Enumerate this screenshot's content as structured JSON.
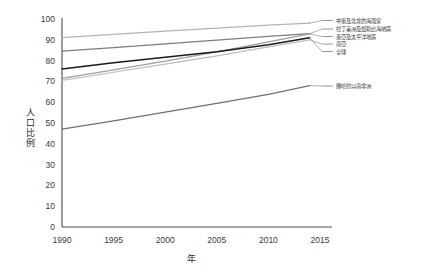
{
  "chart_data": {
    "type": "line",
    "title": "",
    "xlabel": "年",
    "ylabel": "人口比例",
    "xlim": [
      1990,
      2015
    ],
    "ylim": [
      0,
      100
    ],
    "xticks": [
      "1990",
      "1995",
      "2000",
      "2005",
      "2010",
      "2015"
    ],
    "xtick_values": [
      1990,
      1995,
      2000,
      2005,
      2010,
      2015
    ],
    "yticks": [
      "0",
      "10",
      "20",
      "30",
      "40",
      "50",
      "60",
      "70",
      "80",
      "90",
      "100"
    ],
    "ytick_values": [
      0,
      10,
      20,
      30,
      40,
      50,
      60,
      70,
      80,
      90,
      100
    ],
    "grid": false,
    "legend_position": "right-outside-with-leader-lines",
    "x": [
      1990,
      1995,
      2000,
      2005,
      2010,
      2014
    ],
    "series": [
      {
        "name": "中東及北非的海灣家",
        "color": "#b4b4b4",
        "width": 1.25,
        "values": [
          91.0,
          92.6,
          94.2,
          95.6,
          97.0,
          98.0
        ]
      },
      {
        "name": "拉丁美洲及加勒比海地區",
        "color": "#7d7d7d",
        "width": 1.25,
        "values": [
          84.5,
          86.2,
          88.0,
          89.8,
          91.6,
          93.0
        ]
      },
      {
        "name": "東亞及太平洋地區",
        "color": "#9e9e9e",
        "width": 1.25,
        "values": [
          71.5,
          75.5,
          79.8,
          84.2,
          89.0,
          92.8
        ]
      },
      {
        "name": "南亞",
        "color": "#bdbdbd",
        "width": 1.25,
        "values": [
          70.5,
          74.4,
          78.3,
          82.3,
          86.6,
          90.0
        ]
      },
      {
        "name": "全球",
        "color": "#1a1a1a",
        "width": 1.5,
        "values": [
          76.0,
          79.0,
          81.6,
          84.2,
          87.6,
          91.0
        ]
      },
      {
        "name": "撒哈拉以南非洲",
        "color": "#6f6f6f",
        "width": 1.25,
        "values": [
          47.0,
          51.0,
          55.2,
          59.4,
          63.8,
          68.0
        ]
      }
    ],
    "legend_entries": [
      {
        "label": "中東及北非的海灣家",
        "color": "#b4b4b4"
      },
      {
        "label": "拉丁美洲及加勒比海地區",
        "color": "#7d7d7d"
      },
      {
        "label": "東亞及太平洋地區",
        "color": "#9e9e9e"
      },
      {
        "label": "南亞",
        "color": "#bdbdbd"
      },
      {
        "label": "全球",
        "color": "#1a1a1a"
      },
      {
        "label": "撒哈拉以南非洲",
        "color": "#6f6f6f"
      }
    ]
  }
}
